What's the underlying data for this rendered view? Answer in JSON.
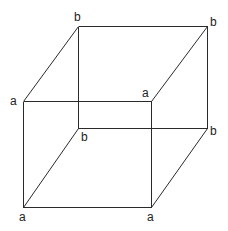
{
  "diagram": {
    "type": "wireframe-cube",
    "vertices": [
      {
        "id": "back-top-left",
        "label": "b",
        "x": 78,
        "y": 26,
        "lx": 74,
        "ly": 21
      },
      {
        "id": "back-top-right",
        "label": "b",
        "x": 207,
        "y": 26,
        "lx": 210,
        "ly": 26
      },
      {
        "id": "front-top-left",
        "label": "a",
        "x": 23,
        "y": 101,
        "lx": 10,
        "ly": 105
      },
      {
        "id": "front-top-right",
        "label": "a",
        "x": 151,
        "y": 101,
        "lx": 142,
        "ly": 97
      },
      {
        "id": "back-bottom-left",
        "label": "b",
        "x": 78,
        "y": 128,
        "lx": 81,
        "ly": 141
      },
      {
        "id": "back-bottom-right",
        "label": "b",
        "x": 207,
        "y": 128,
        "lx": 210,
        "ly": 135
      },
      {
        "id": "front-bottom-left",
        "label": "a",
        "x": 23,
        "y": 207,
        "lx": 19,
        "ly": 221
      },
      {
        "id": "front-bottom-right",
        "label": "a",
        "x": 151,
        "y": 207,
        "lx": 147,
        "ly": 221
      }
    ],
    "edges": [
      [
        "back-top-left",
        "back-top-right"
      ],
      [
        "back-top-left",
        "back-bottom-left"
      ],
      [
        "back-top-right",
        "back-bottom-right"
      ],
      [
        "back-bottom-left",
        "back-bottom-right"
      ],
      [
        "front-top-left",
        "front-top-right"
      ],
      [
        "front-top-left",
        "front-bottom-left"
      ],
      [
        "front-top-right",
        "front-bottom-right"
      ],
      [
        "front-bottom-left",
        "front-bottom-right"
      ],
      [
        "front-top-left",
        "back-top-left"
      ],
      [
        "front-top-right",
        "back-top-right"
      ],
      [
        "front-bottom-left",
        "back-bottom-left"
      ],
      [
        "front-bottom-right",
        "back-bottom-right"
      ]
    ],
    "line_color": "#2a2a2a",
    "label_color": "#222222"
  }
}
